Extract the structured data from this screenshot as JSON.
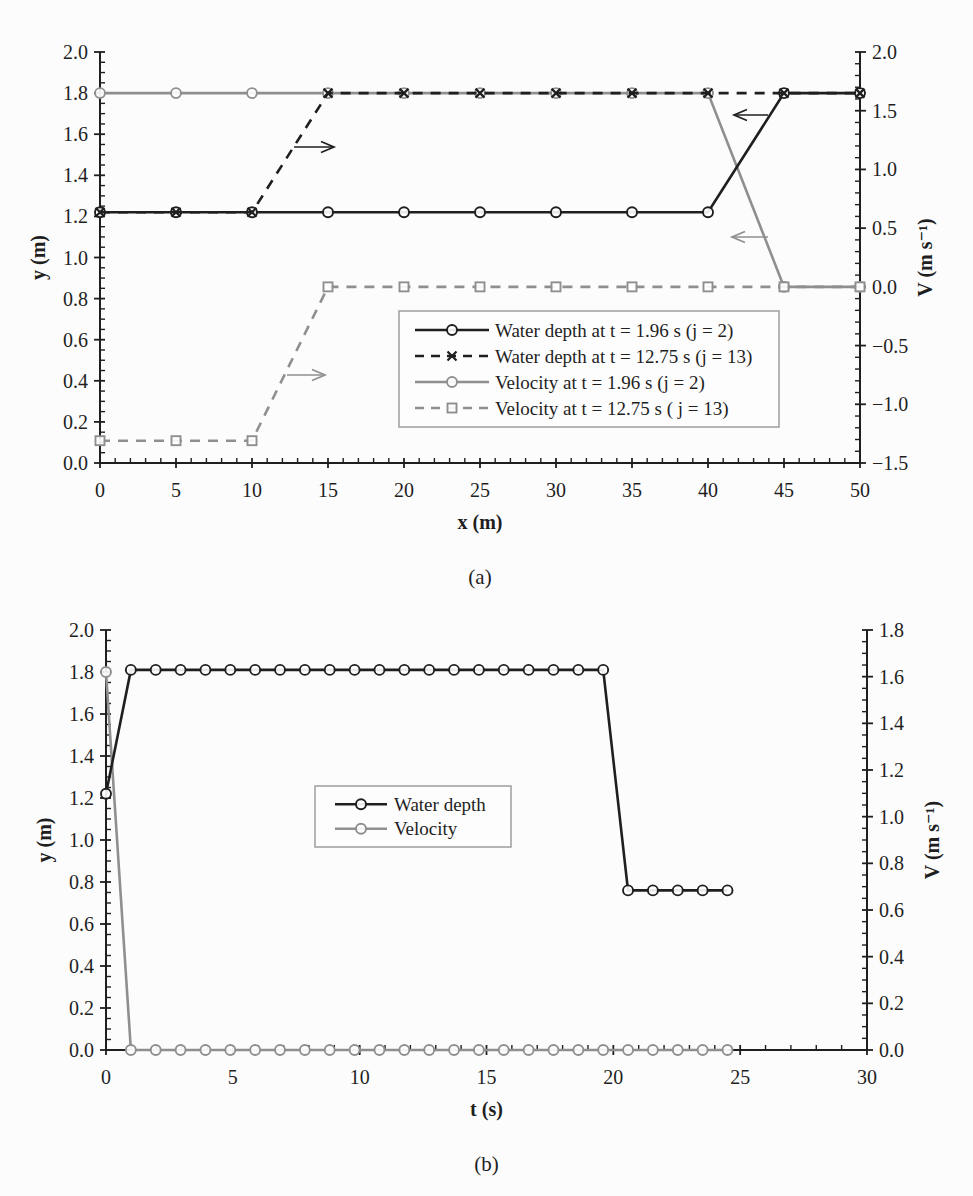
{
  "colors": {
    "black": "#1f1f1f",
    "gray": "#8f8f8f",
    "legend_border": "#9d9d9d",
    "background": "#fcfcfc"
  },
  "chart_data": [
    {
      "id": "a",
      "type": "line",
      "caption": "(a)",
      "x_axis": {
        "label": "x (m)",
        "min": 0,
        "max": 50,
        "major_step": 5,
        "minor_step": 1,
        "decimals": 0
      },
      "left_axis": {
        "label": "y (m)",
        "min": 0,
        "max": 2.0,
        "major_step": 0.2,
        "minor_step": 0.05,
        "decimals": 1
      },
      "right_axis": {
        "label": "V (m s⁻¹)",
        "min": -1.5,
        "max": 2.0,
        "major_step": 0.5,
        "minor_step": 0.1,
        "decimals": 1
      },
      "plot": {
        "left": 100,
        "right": 860,
        "top": 52,
        "bottom": 463
      },
      "series": [
        {
          "name": "Velocity at t = 1.96 s (j = 2)",
          "axis": "right",
          "color": "gray",
          "dash": "solid",
          "marker": "circle",
          "points": [
            [
              0,
              1.65
            ],
            [
              5,
              1.65
            ],
            [
              10,
              1.65
            ],
            [
              15,
              1.65
            ],
            [
              20,
              1.65
            ],
            [
              25,
              1.65
            ],
            [
              30,
              1.65
            ],
            [
              35,
              1.65
            ],
            [
              40,
              1.65
            ],
            [
              45,
              0
            ],
            [
              50,
              0
            ]
          ]
        },
        {
          "name": "Velocity at t = 12.75 s ( j = 13)",
          "axis": "right",
          "color": "gray",
          "dash": "dashed",
          "marker": "square",
          "points": [
            [
              0,
              -1.31
            ],
            [
              5,
              -1.31
            ],
            [
              10,
              -1.31
            ],
            [
              15,
              0
            ],
            [
              20,
              0
            ],
            [
              25,
              0
            ],
            [
              30,
              0
            ],
            [
              35,
              0
            ],
            [
              40,
              0
            ],
            [
              45,
              0
            ],
            [
              50,
              0
            ]
          ]
        },
        {
          "name": "Water depth at t = 1.96 s (j = 2)",
          "axis": "left",
          "color": "black",
          "dash": "solid",
          "marker": "circle",
          "points": [
            [
              0,
              1.22
            ],
            [
              5,
              1.22
            ],
            [
              10,
              1.22
            ],
            [
              15,
              1.22
            ],
            [
              20,
              1.22
            ],
            [
              25,
              1.22
            ],
            [
              30,
              1.22
            ],
            [
              35,
              1.22
            ],
            [
              40,
              1.22
            ],
            [
              45,
              1.8
            ],
            [
              50,
              1.8
            ]
          ]
        },
        {
          "name": "Water depth at t = 12.75 s (j = 13)",
          "axis": "left",
          "color": "black",
          "dash": "dashed",
          "marker": "x",
          "points": [
            [
              0,
              1.22
            ],
            [
              5,
              1.22
            ],
            [
              10,
              1.22
            ],
            [
              15,
              1.8
            ],
            [
              20,
              1.8
            ],
            [
              25,
              1.8
            ],
            [
              30,
              1.8
            ],
            [
              35,
              1.8
            ],
            [
              40,
              1.8
            ],
            [
              45,
              1.8
            ],
            [
              50,
              1.8
            ]
          ]
        }
      ],
      "legend": {
        "x": 399,
        "y": 311,
        "width": 380,
        "height": 116,
        "sample_x1": 16,
        "sample_x2": 90,
        "text_x": 96,
        "entries": [
          {
            "label": "Water depth at t = 1.96 s (j = 2)",
            "color": "black",
            "dash": "solid",
            "marker": "circle"
          },
          {
            "label": "Water depth at t = 12.75 s (j = 13)",
            "color": "black",
            "dash": "dashed",
            "marker": "x"
          },
          {
            "label": "Velocity at t = 1.96 s (j = 2)",
            "color": "gray",
            "dash": "solid",
            "marker": "circle"
          },
          {
            "label": "Velocity at t = 12.75 s ( j = 13)",
            "color": "gray",
            "dash": "dashed",
            "marker": "square"
          }
        ]
      },
      "annotations": [
        {
          "type": "arrow",
          "color": "black",
          "x1": 294,
          "y1": 147,
          "x2": 334,
          "y2": 147
        },
        {
          "type": "arrow",
          "color": "gray",
          "x1": 287,
          "y1": 375,
          "x2": 325,
          "y2": 375
        },
        {
          "type": "arrow",
          "color": "black",
          "x1": 768,
          "y1": 115,
          "x2": 734,
          "y2": 115
        },
        {
          "type": "arrow",
          "color": "gray",
          "x1": 768,
          "y1": 237,
          "x2": 732,
          "y2": 237
        }
      ]
    },
    {
      "id": "b",
      "type": "line",
      "caption": "(b)",
      "x_axis": {
        "label": "t (s)",
        "min": 0,
        "max": 30,
        "major_step": 5,
        "minor_step": 1,
        "decimals": 0
      },
      "left_axis": {
        "label": "y (m)",
        "min": 0,
        "max": 2.0,
        "major_step": 0.2,
        "minor_step": 0.05,
        "decimals": 1
      },
      "right_axis": {
        "label": "V (m s⁻¹)",
        "min": 0,
        "max": 1.8,
        "major_step": 0.2,
        "minor_step": 0.05,
        "decimals": 1
      },
      "plot": {
        "left": 106,
        "right": 867,
        "top": 630,
        "bottom": 1050
      },
      "series": [
        {
          "name": "Velocity",
          "axis": "right",
          "color": "gray",
          "dash": "solid",
          "marker": "circle",
          "points": [
            [
              0,
              1.62
            ],
            [
              0.98,
              0
            ],
            [
              1.96,
              0
            ],
            [
              2.94,
              0
            ],
            [
              3.92,
              0
            ],
            [
              4.9,
              0
            ],
            [
              5.88,
              0
            ],
            [
              6.86,
              0
            ],
            [
              7.84,
              0
            ],
            [
              8.82,
              0
            ],
            [
              9.8,
              0
            ],
            [
              10.78,
              0
            ],
            [
              11.76,
              0
            ],
            [
              12.74,
              0
            ],
            [
              13.72,
              0
            ],
            [
              14.7,
              0
            ],
            [
              15.68,
              0
            ],
            [
              16.66,
              0
            ],
            [
              17.64,
              0
            ],
            [
              18.62,
              0
            ],
            [
              19.6,
              0
            ],
            [
              20.58,
              0
            ],
            [
              21.56,
              0
            ],
            [
              22.54,
              0
            ],
            [
              23.52,
              0
            ],
            [
              24.5,
              0
            ]
          ]
        },
        {
          "name": "Water depth",
          "axis": "left",
          "color": "black",
          "dash": "solid",
          "marker": "circle",
          "points": [
            [
              0,
              1.22
            ],
            [
              0.98,
              1.81
            ],
            [
              1.96,
              1.81
            ],
            [
              2.94,
              1.81
            ],
            [
              3.92,
              1.81
            ],
            [
              4.9,
              1.81
            ],
            [
              5.88,
              1.81
            ],
            [
              6.86,
              1.81
            ],
            [
              7.84,
              1.81
            ],
            [
              8.82,
              1.81
            ],
            [
              9.8,
              1.81
            ],
            [
              10.78,
              1.81
            ],
            [
              11.76,
              1.81
            ],
            [
              12.74,
              1.81
            ],
            [
              13.72,
              1.81
            ],
            [
              14.7,
              1.81
            ],
            [
              15.68,
              1.81
            ],
            [
              16.66,
              1.81
            ],
            [
              17.64,
              1.81
            ],
            [
              18.62,
              1.81
            ],
            [
              19.6,
              1.81
            ],
            [
              20.58,
              0.76
            ],
            [
              21.56,
              0.76
            ],
            [
              22.54,
              0.76
            ],
            [
              23.52,
              0.76
            ],
            [
              24.5,
              0.76
            ]
          ]
        }
      ],
      "legend": {
        "x": 315,
        "y": 786,
        "width": 196,
        "height": 61,
        "sample_x1": 20,
        "sample_x2": 72,
        "text_x": 79,
        "entries": [
          {
            "label": "Water depth",
            "color": "black",
            "dash": "solid",
            "marker": "circle"
          },
          {
            "label": "Velocity",
            "color": "gray",
            "dash": "solid",
            "marker": "circle"
          }
        ]
      },
      "annotations": []
    }
  ]
}
